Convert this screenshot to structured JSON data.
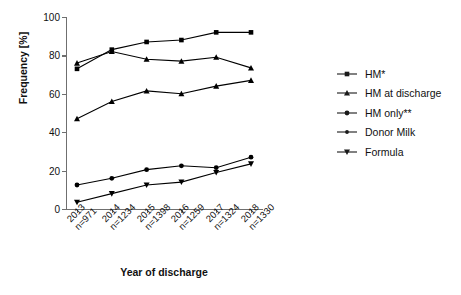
{
  "chart_data": {
    "type": "line",
    "title": "",
    "xlabel": "Year of discharge",
    "ylabel": "Frequency [%]",
    "ylim": [
      0,
      100
    ],
    "yticks": [
      0,
      20,
      40,
      60,
      80,
      100
    ],
    "ytick_labels": [
      "0",
      "20",
      "40",
      "60",
      "80",
      "100"
    ],
    "grid": false,
    "legend_position": "right",
    "categories": [
      "2013",
      "2014",
      "2015",
      "2016",
      "2017",
      "2018"
    ],
    "category_sublabels": [
      "n=971",
      "n=1234",
      "n=1398",
      "n=1259",
      "n=1324",
      "n=1330"
    ],
    "xtick_labels": [
      {
        "year": "2013",
        "n": "n=971"
      },
      {
        "year": "2014",
        "n": "n=1234"
      },
      {
        "year": "2015",
        "n": "n=1398"
      },
      {
        "year": "2016",
        "n": "n=1259"
      },
      {
        "year": "2017",
        "n": "n=1324"
      },
      {
        "year": "2018",
        "n": "n=1330"
      }
    ],
    "series": [
      {
        "name": "HM*",
        "marker": "square",
        "color": "#000000",
        "values": [
          73,
          83,
          87,
          88,
          92,
          92
        ]
      },
      {
        "name": "HM at discharge",
        "marker": "triangle-up",
        "color": "#000000",
        "values": [
          76,
          82,
          78,
          77,
          79,
          73.5
        ]
      },
      {
        "name": "HM only**",
        "marker": "triangle-up",
        "color": "#000000",
        "values": [
          47,
          56,
          61.5,
          60,
          64,
          67
        ]
      },
      {
        "name": "Donor Milk",
        "marker": "circle",
        "color": "#000000",
        "values": [
          12.5,
          16,
          20.5,
          22.5,
          21.5,
          27
        ]
      },
      {
        "name": "Formula",
        "marker": "triangle-down",
        "color": "#000000",
        "values": [
          3.5,
          8,
          12.5,
          14,
          19,
          23.5
        ]
      }
    ]
  },
  "legend": {
    "items": [
      {
        "label": "HM*",
        "marker": "square"
      },
      {
        "label": "HM at discharge",
        "marker": "triangle-up"
      },
      {
        "label": "HM only**",
        "marker": "circle"
      },
      {
        "label": "Donor Milk",
        "marker": "circle-small"
      },
      {
        "label": "Formula",
        "marker": "triangle-down"
      }
    ]
  },
  "colors": {
    "axis": "#6f6f6f",
    "line": "#1a1a1a",
    "text": "#111111",
    "background": "#ffffff"
  }
}
